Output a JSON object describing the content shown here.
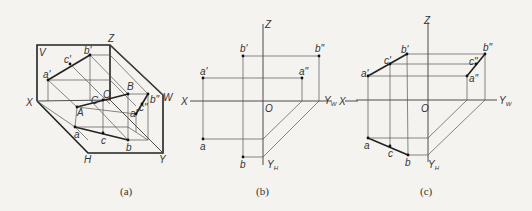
{
  "figure": {
    "panels": [
      {
        "id": "a",
        "caption": "(a)",
        "description": "Pictorial view of three projection planes V, H, W with line AB and point C on it, projected onto each plane",
        "labels": {
          "V": "V",
          "Z": "Z",
          "X": "X",
          "O": "O",
          "W": "W",
          "H": "H",
          "Y": "Y",
          "A": "A",
          "B": "B",
          "C": "C",
          "a1": "a'",
          "b1": "b'",
          "c1": "c'",
          "a2": "a\"",
          "b2": "b\"",
          "c2": "c\"",
          "a": "a",
          "b": "b",
          "c": "c"
        }
      },
      {
        "id": "b",
        "caption": "(b)",
        "description": "Orthographic projection of points A and B",
        "labels": {
          "Z": "Z",
          "X_left": "X",
          "X_right": "X",
          "O": "O",
          "Yw": "Y",
          "Yw_sub": "W",
          "Yh": "Y",
          "Yh_sub": "H",
          "a1": "a'",
          "b1": "b'",
          "a2": "a\"",
          "b2": "b\"",
          "a": "a",
          "b": "b"
        }
      },
      {
        "id": "c",
        "caption": "(c)",
        "description": "Orthographic projection of line AB with point C on it",
        "labels": {
          "Z": "Z",
          "O": "O",
          "Yw": "Y",
          "Yw_sub": "W",
          "Yh": "Y",
          "Yh_sub": "H",
          "a1": "a'",
          "b1": "b'",
          "c1": "c'",
          "a2": "a\"",
          "b2": "b\"",
          "c2": "c\"",
          "a": "a",
          "b": "b",
          "c": "c"
        }
      }
    ]
  }
}
